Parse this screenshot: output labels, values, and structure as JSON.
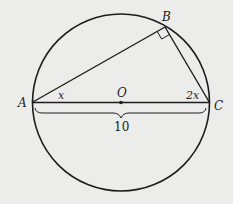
{
  "diagram": {
    "type": "geometry",
    "colors": {
      "background": "#ececea",
      "stroke": "#1c1c1c"
    },
    "circle": {
      "center_label": "O"
    },
    "points": {
      "A": {
        "label": "A"
      },
      "B": {
        "label": "B"
      },
      "C": {
        "label": "C"
      },
      "O": {
        "label": "O"
      }
    },
    "angles": {
      "at_A": "x",
      "at_C": "2x",
      "at_B": "right-angle"
    },
    "measurements": {
      "diameter_AC": "10"
    }
  }
}
